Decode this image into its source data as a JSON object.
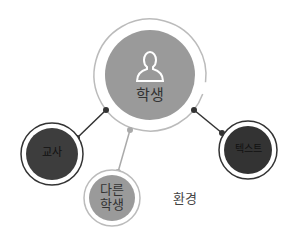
{
  "diagram": {
    "center_node": {
      "label": "학생",
      "icon": "person-icon",
      "fill": "#9a9a9a"
    },
    "nodes": [
      {
        "id": "teacher",
        "label": "교사",
        "fill": "#3d3d3d"
      },
      {
        "id": "text",
        "label": "텍스트",
        "fill": "#333333"
      },
      {
        "id": "other-students",
        "label_line1": "다른",
        "label_line2": "학생",
        "fill": "#9a9a9a"
      }
    ],
    "environment_label": "환경",
    "colors": {
      "ring": "#bbbbbb",
      "dark_line": "#333333",
      "light_line": "#aaaaaa"
    }
  }
}
